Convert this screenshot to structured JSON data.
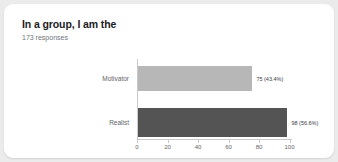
{
  "card": {
    "title": "In a group, I am the",
    "subtitle": "173 responses"
  },
  "chart_data": {
    "type": "bar",
    "orientation": "horizontal",
    "title": "In a group, I am the",
    "subtitle": "173 responses",
    "categories": [
      "Motivator",
      "Realist"
    ],
    "values": [
      75,
      98
    ],
    "percents": [
      "43.4%",
      "56.6%"
    ],
    "data_labels": [
      "75 (43.4%)",
      "98 (56.6%)"
    ],
    "colors": [
      "#b7b7b7",
      "#545454"
    ],
    "xlabel": "",
    "ylabel": "",
    "xlim": [
      0,
      110
    ],
    "xticks": [
      0,
      20,
      40,
      60,
      80,
      100
    ],
    "xtick_labels": [
      "0",
      "20",
      "40",
      "60",
      "80",
      "100"
    ],
    "grid": false,
    "legend": false,
    "total_responses": 173
  },
  "theme": {
    "page_background": "#ebebeb",
    "card_background": "#ffffff",
    "title_color": "#202124",
    "subtitle_color": "#70757a",
    "axis_color": "#c9c9c9",
    "label_color": "#5f6368"
  }
}
